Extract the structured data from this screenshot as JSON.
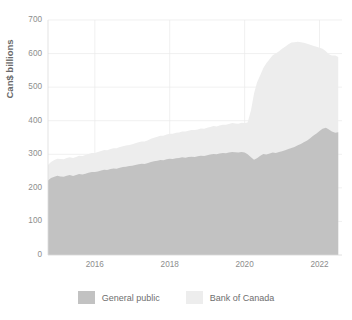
{
  "chart": {
    "title": "",
    "y_axis_title": "Can$ billions",
    "x_axis_title": ""
  },
  "legend": {
    "items": [
      {
        "label": "General public",
        "color": "#c2c2c2"
      },
      {
        "label": "Bank of Canada",
        "color": "#ededed"
      }
    ]
  },
  "axes": {
    "y_ticks": [
      "0",
      "100",
      "200",
      "300",
      "400",
      "500",
      "600",
      "700"
    ],
    "x_ticks": [
      "2016",
      "2018",
      "2020",
      "2022"
    ]
  },
  "chart_data": {
    "type": "area",
    "stacked": true,
    "title": "",
    "xlabel": "",
    "ylabel": "Can$ billions",
    "ylim": [
      0,
      700
    ],
    "xlim": [
      2014.75,
      2022.6
    ],
    "grid": true,
    "legend_position": "bottom",
    "y_ticks": [
      0,
      100,
      200,
      300,
      400,
      500,
      600,
      700
    ],
    "x_ticks": [
      2016,
      2018,
      2020,
      2022
    ],
    "x": [
      2014.75,
      2014.83,
      2014.92,
      2015.0,
      2015.08,
      2015.17,
      2015.25,
      2015.33,
      2015.42,
      2015.5,
      2015.58,
      2015.67,
      2015.75,
      2015.83,
      2015.92,
      2016.0,
      2016.08,
      2016.17,
      2016.25,
      2016.33,
      2016.42,
      2016.5,
      2016.58,
      2016.67,
      2016.75,
      2016.83,
      2016.92,
      2017.0,
      2017.08,
      2017.17,
      2017.25,
      2017.33,
      2017.42,
      2017.5,
      2017.58,
      2017.67,
      2017.75,
      2017.83,
      2017.92,
      2018.0,
      2018.08,
      2018.17,
      2018.25,
      2018.33,
      2018.42,
      2018.5,
      2018.58,
      2018.67,
      2018.75,
      2018.83,
      2018.92,
      2019.0,
      2019.08,
      2019.17,
      2019.25,
      2019.33,
      2019.42,
      2019.5,
      2019.58,
      2019.67,
      2019.75,
      2019.83,
      2019.92,
      2020.0,
      2020.08,
      2020.17,
      2020.25,
      2020.33,
      2020.42,
      2020.5,
      2020.58,
      2020.67,
      2020.75,
      2020.83,
      2020.92,
      2021.0,
      2021.08,
      2021.17,
      2021.25,
      2021.33,
      2021.42,
      2021.5,
      2021.58,
      2021.67,
      2021.75,
      2021.83,
      2021.92,
      2022.0,
      2022.08,
      2022.17,
      2022.25,
      2022.33,
      2022.42,
      2022.5
    ],
    "series": [
      {
        "name": "General public",
        "color": "#c2c2c2",
        "values": [
          222,
          229,
          233,
          236,
          234,
          233,
          236,
          238,
          235,
          238,
          241,
          240,
          242,
          245,
          247,
          247,
          249,
          252,
          254,
          253,
          256,
          258,
          257,
          260,
          262,
          263,
          265,
          266,
          268,
          270,
          272,
          271,
          274,
          277,
          279,
          281,
          283,
          282,
          285,
          287,
          286,
          288,
          289,
          291,
          290,
          292,
          293,
          292,
          294,
          296,
          295,
          297,
          299,
          301,
          300,
          302,
          304,
          303,
          305,
          307,
          306,
          305,
          307,
          305,
          300,
          291,
          284,
          288,
          296,
          301,
          299,
          302,
          305,
          304,
          307,
          309,
          312,
          316,
          319,
          322,
          327,
          331,
          336,
          341,
          348,
          355,
          362,
          369,
          376,
          379,
          374,
          368,
          364,
          366
        ]
      },
      {
        "name": "Bank of Canada",
        "color": "#ededed",
        "values": [
          46,
          48,
          50,
          51,
          52,
          52,
          53,
          53,
          54,
          54,
          55,
          55,
          56,
          56,
          57,
          57,
          58,
          58,
          59,
          59,
          60,
          60,
          61,
          62,
          62,
          63,
          63,
          64,
          65,
          66,
          66,
          67,
          68,
          69,
          70,
          71,
          72,
          73,
          74,
          74,
          75,
          76,
          76,
          77,
          78,
          78,
          79,
          80,
          80,
          81,
          81,
          82,
          82,
          83,
          83,
          84,
          84,
          85,
          85,
          86,
          86,
          86,
          87,
          88,
          95,
          140,
          196,
          226,
          240,
          256,
          272,
          282,
          290,
          296,
          300,
          305,
          308,
          312,
          314,
          312,
          308,
          303,
          296,
          288,
          278,
          268,
          258,
          248,
          238,
          228,
          224,
          226,
          230,
          224
        ]
      }
    ]
  },
  "geometry": {
    "plot_left": 48,
    "plot_right": 342,
    "plot_top": 20,
    "plot_bottom": 255
  }
}
